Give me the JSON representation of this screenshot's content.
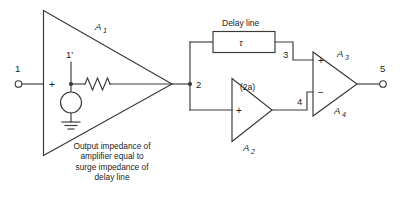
{
  "diagram": {
    "colors": {
      "line": "#3a3a3a",
      "text": "#1c1c1c",
      "background": "#ffffff"
    },
    "terminals": [
      {
        "id": "in",
        "label": "1"
      },
      {
        "id": "source_node",
        "label": "1'"
      },
      {
        "id": "node2",
        "label": "2"
      },
      {
        "id": "node3",
        "label": "3"
      },
      {
        "id": "node4",
        "label": "4"
      },
      {
        "id": "out",
        "label": "5"
      }
    ],
    "amplifiers": [
      {
        "id": "a1",
        "label": "A",
        "sub": "1",
        "plus": "+"
      },
      {
        "id": "a2",
        "label": "A",
        "sub": "2",
        "plus": "+",
        "gain": "(2a)"
      },
      {
        "id": "a3",
        "label": "A",
        "sub": "3",
        "plus": "+"
      },
      {
        "id": "a4",
        "label": "A",
        "sub": "4",
        "minus": "−"
      }
    ],
    "delay_line": {
      "title": "Delay line",
      "symbol": "τ"
    },
    "caption": {
      "line1": "Output impedance of",
      "line2": "amplifier equal to",
      "line3": "surge impedance of",
      "line4": "delay line"
    }
  }
}
